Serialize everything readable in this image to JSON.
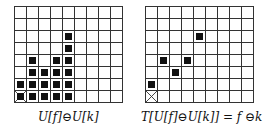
{
  "figure": {
    "grid": {
      "columns": 9,
      "rows": 8
    },
    "panels": [
      {
        "id": "left",
        "caption": "U[f]⊖U[k]",
        "origin": {
          "row": 7,
          "col": 0,
          "marked": true
        },
        "filled_cells": [
          [
            2,
            4
          ],
          [
            3,
            4
          ],
          [
            4,
            1
          ],
          [
            4,
            3
          ],
          [
            4,
            4
          ],
          [
            5,
            1
          ],
          [
            5,
            2
          ],
          [
            5,
            3
          ],
          [
            5,
            4
          ],
          [
            6,
            0
          ],
          [
            6,
            1
          ],
          [
            6,
            2
          ],
          [
            6,
            3
          ],
          [
            6,
            4
          ],
          [
            7,
            0
          ],
          [
            7,
            1
          ],
          [
            7,
            2
          ],
          [
            7,
            3
          ],
          [
            7,
            4
          ]
        ]
      },
      {
        "id": "right",
        "caption": "T[U[f]⊖U[k]] = f ⊖k",
        "origin": {
          "row": 7,
          "col": 0,
          "marked": true
        },
        "filled_cells": [
          [
            2,
            4
          ],
          [
            4,
            1
          ],
          [
            4,
            3
          ],
          [
            5,
            2
          ],
          [
            6,
            0
          ]
        ]
      }
    ]
  }
}
